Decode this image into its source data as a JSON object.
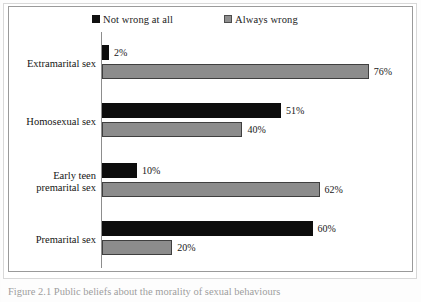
{
  "figure": {
    "caption": "Figure 2.1 Public beliefs about the morality of sexual behaviours"
  },
  "legend": {
    "position": "top",
    "items": [
      {
        "label": "Not wrong at all",
        "marker": "filled-square-icon",
        "color": "#0d0d0d"
      },
      {
        "label": "Always wrong",
        "marker": "filled-square-icon",
        "color": "#8c8c8c"
      }
    ]
  },
  "chart_data": {
    "type": "bar",
    "orientation": "horizontal",
    "title": "",
    "subtitle": "",
    "xlabel": "",
    "ylabel": "",
    "grid": false,
    "legend_position": "top",
    "xlim": [
      0,
      80
    ],
    "value_suffix": "%",
    "categories": [
      "Extramarital sex",
      "Homosexual sex",
      "Early teen premarital sex",
      "Premarital sex"
    ],
    "category_lines": [
      [
        "Extramarital sex"
      ],
      [
        "Homosexual sex"
      ],
      [
        "Early teen",
        "premarital sex"
      ],
      [
        "Premarital sex"
      ]
    ],
    "series": [
      {
        "name": "Not wrong at all",
        "color": "#0d0d0d",
        "values": [
          2,
          51,
          10,
          60
        ],
        "labels": [
          "2%",
          "51%",
          "10%",
          "60%"
        ]
      },
      {
        "name": "Always wrong",
        "color": "#8c8c8c",
        "values": [
          76,
          40,
          62,
          20
        ],
        "labels": [
          "76%",
          "40%",
          "62%",
          "20%"
        ]
      }
    ]
  }
}
